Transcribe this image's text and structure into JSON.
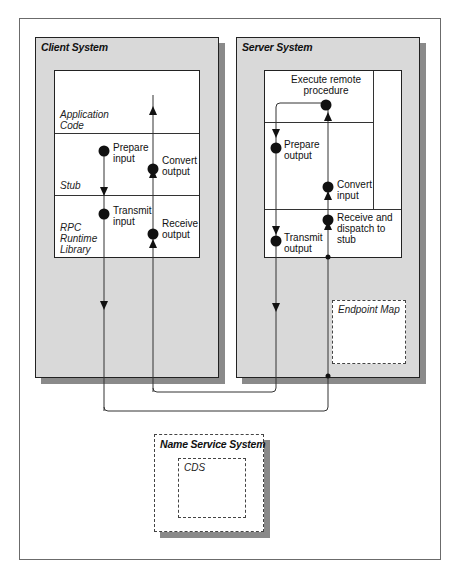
{
  "diagram": {
    "client": {
      "title": "Client System",
      "layers": {
        "app": [
          "Application",
          "Code"
        ],
        "stub": "Stub",
        "rpc": [
          "RPC",
          "Runtime",
          "Library"
        ]
      },
      "steps": [
        {
          "num": "10",
          "label1": "Prepare",
          "label2": "input"
        },
        {
          "num": "11",
          "label1": "Transmit",
          "label2": "input"
        },
        {
          "num": "17",
          "label1": "Receive",
          "label2": "output"
        },
        {
          "num": "18",
          "label1": "Convert",
          "label2": "output"
        }
      ]
    },
    "server": {
      "title": "Server System",
      "execute": [
        "Execute remote",
        "procedure"
      ],
      "steps": [
        {
          "num": "12",
          "label1": "Receive and",
          "label2": "dispatch to",
          "label3": "stub"
        },
        {
          "num": "13",
          "label1": "Convert",
          "label2": "input"
        },
        {
          "num": "14",
          "label1": "",
          "label2": ""
        },
        {
          "num": "15",
          "label1": "Prepare",
          "label2": "output"
        },
        {
          "num": "16",
          "label1": "Transmit",
          "label2": "output"
        }
      ],
      "endpoint_map": "Endpoint Map"
    },
    "name_service": {
      "title": "Name Service System",
      "cds": "CDS"
    },
    "colors": {
      "system_fill": "#d9d9d9",
      "shadow": "#8a8a8a",
      "line": "#222222"
    }
  }
}
